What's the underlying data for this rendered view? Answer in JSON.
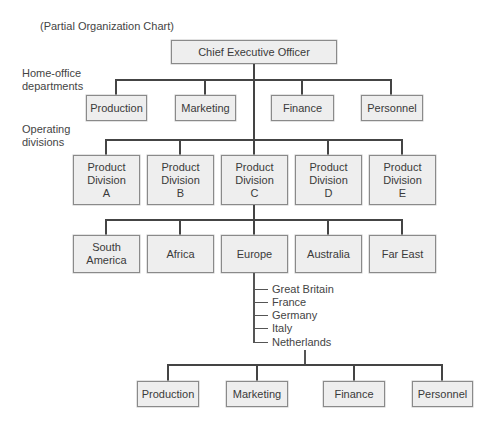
{
  "subtitle": "(Partial Organization Chart)",
  "ceo": {
    "label": "Chief Executive Officer"
  },
  "section_labels": {
    "home_office": "Home-office\ndepartments",
    "operating": "Operating\ndivisions"
  },
  "home_office_departments": [
    {
      "label": "Production"
    },
    {
      "label": "Marketing"
    },
    {
      "label": "Finance"
    },
    {
      "label": "Personnel"
    }
  ],
  "product_divisions": [
    {
      "label": "Product\nDivision\nA"
    },
    {
      "label": "Product\nDivision\nB"
    },
    {
      "label": "Product\nDivision\nC"
    },
    {
      "label": "Product\nDivision\nD"
    },
    {
      "label": "Product\nDivision\nE"
    }
  ],
  "regions": [
    {
      "label": "South\nAmerica"
    },
    {
      "label": "Africa"
    },
    {
      "label": "Europe"
    },
    {
      "label": "Australia"
    },
    {
      "label": "Far East"
    }
  ],
  "countries": [
    {
      "label": "Great Britain"
    },
    {
      "label": "France"
    },
    {
      "label": "Germany"
    },
    {
      "label": "Italy"
    },
    {
      "label": "Netherlands"
    }
  ],
  "country_departments": [
    {
      "label": "Production"
    },
    {
      "label": "Marketing"
    },
    {
      "label": "Finance"
    },
    {
      "label": "Personnel"
    }
  ],
  "colors": {
    "box_fill": "#eeeeee",
    "box_border": "#8a8a8a",
    "line": "#444444",
    "text": "#3a3a3a"
  }
}
